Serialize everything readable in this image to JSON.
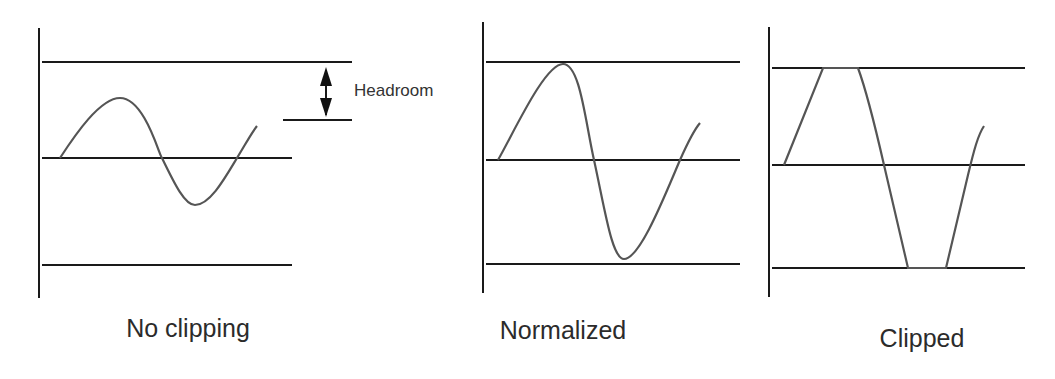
{
  "panels": [
    {
      "label": "No clipping"
    },
    {
      "label": "Normalized"
    },
    {
      "label": "Clipped"
    }
  ],
  "annotations": {
    "headroom": "Headroom"
  },
  "colors": {
    "lines": "#1a1a1a",
    "wave": "#555555",
    "text": "#2b2b2b"
  }
}
